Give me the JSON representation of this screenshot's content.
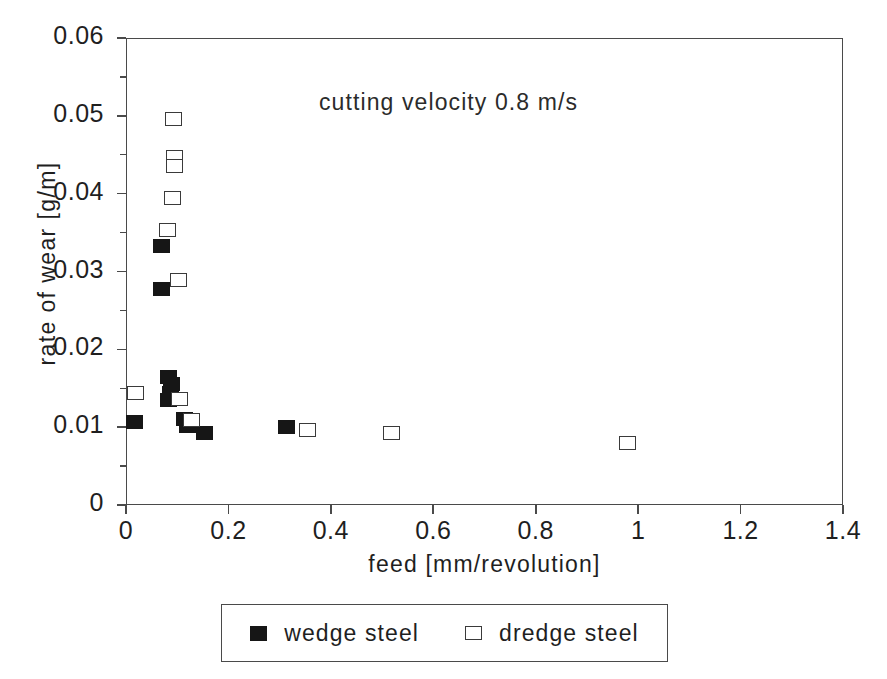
{
  "chart_data": {
    "type": "scatter",
    "title": "",
    "annotation": "cutting velocity 0.8 m/s",
    "xlabel": "feed [mm/revolution]",
    "ylabel": "rate of wear [g/m]",
    "xlim": [
      0,
      1.4
    ],
    "ylim": [
      0,
      0.06
    ],
    "xticks": [
      "0",
      "0.2",
      "0.4",
      "0.6",
      "0.8",
      "1",
      "1.2",
      "1.4"
    ],
    "xtick_values": [
      0,
      0.2,
      0.4,
      0.6,
      0.8,
      1.0,
      1.2,
      1.4
    ],
    "yticks": [
      "0",
      "0.01",
      "0.02",
      "0.03",
      "0.04",
      "0.05",
      "0.06"
    ],
    "ytick_values": [
      0,
      0.01,
      0.02,
      0.03,
      0.04,
      0.05,
      0.06
    ],
    "grid": false,
    "legend_position": "below-axes",
    "marker_colors": {
      "filled": "#161616",
      "open_edge": "#3a3a3a",
      "open_face": "#ffffff"
    },
    "axis_color": "#4a4a4a",
    "series": [
      {
        "name": "wedge steel",
        "marker": "filled-square",
        "points": [
          {
            "x": 0.014,
            "y": 0.0108
          },
          {
            "x": 0.068,
            "y": 0.0279
          },
          {
            "x": 0.068,
            "y": 0.0334
          },
          {
            "x": 0.082,
            "y": 0.0166
          },
          {
            "x": 0.086,
            "y": 0.0157
          },
          {
            "x": 0.084,
            "y": 0.0145
          },
          {
            "x": 0.082,
            "y": 0.0136
          },
          {
            "x": 0.113,
            "y": 0.0112
          },
          {
            "x": 0.118,
            "y": 0.0103
          },
          {
            "x": 0.152,
            "y": 0.0094
          },
          {
            "x": 0.311,
            "y": 0.0102
          }
        ]
      },
      {
        "name": "dredge steel",
        "marker": "open-square",
        "points": [
          {
            "x": 0.016,
            "y": 0.0145
          },
          {
            "x": 0.09,
            "y": 0.0497
          },
          {
            "x": 0.092,
            "y": 0.0449
          },
          {
            "x": 0.092,
            "y": 0.0437
          },
          {
            "x": 0.088,
            "y": 0.0396
          },
          {
            "x": 0.079,
            "y": 0.0355
          },
          {
            "x": 0.1,
            "y": 0.029
          },
          {
            "x": 0.102,
            "y": 0.0138
          },
          {
            "x": 0.126,
            "y": 0.011
          },
          {
            "x": 0.352,
            "y": 0.0098
          },
          {
            "x": 0.516,
            "y": 0.0094
          },
          {
            "x": 0.977,
            "y": 0.0081
          }
        ]
      }
    ]
  },
  "legend": {
    "entries": [
      {
        "label": "wedge steel",
        "marker": "filled-square"
      },
      {
        "label": "dredge steel",
        "marker": "open-square"
      }
    ]
  }
}
